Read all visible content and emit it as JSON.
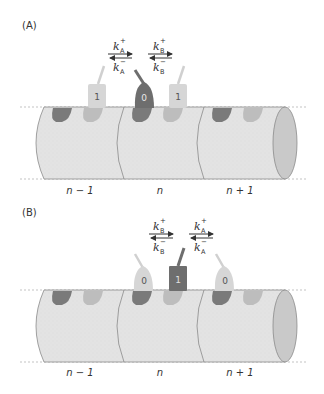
{
  "colors": {
    "cylinder_fill": "#e3e3e3",
    "cylinder_stroke": "#8a8a8a",
    "end_cap": "#c9c9c9",
    "site_dark": "#7a7a7a",
    "site_light": "#bdbdbd",
    "protein_dark": "#6e6e6e",
    "protein_light": "#d6d6d6",
    "dash": "#aaaaaa"
  },
  "panels": [
    {
      "label": "(A)",
      "segments": [
        "n − 1",
        "n",
        "n + 1"
      ],
      "rates": [
        {
          "k": "k",
          "sub": "A",
          "plus": "+",
          "minus": "−"
        },
        {
          "k": "k",
          "sub": "B",
          "plus": "+",
          "minus": "−"
        }
      ],
      "states": [
        "1",
        "0",
        "1"
      ]
    },
    {
      "label": "(B)",
      "segments": [
        "n − 1",
        "n",
        "n + 1"
      ],
      "rates": [
        {
          "k": "k",
          "sub": "B",
          "plus": "+",
          "minus": "−"
        },
        {
          "k": "k",
          "sub": "A",
          "plus": "+",
          "minus": "−"
        }
      ],
      "states": [
        "0",
        "1",
        "0"
      ]
    }
  ]
}
